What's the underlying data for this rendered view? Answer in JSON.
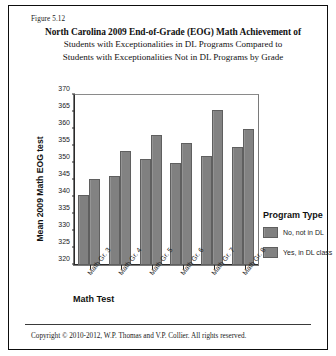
{
  "figure": {
    "caption": "Figure 5.12",
    "title_lines": [
      "North Carolina 2009 End-of-Grade (EOG) Math Achievement of",
      "Students with Exceptionalities in DL Programs Compared to",
      "Students with Exceptionalities Not in DL Programs by Grade"
    ],
    "copyright": "Copyright © 2010-2012, W.P. Thomas and V.P. Collier.  All rights reserved."
  },
  "legend": {
    "title": "Program Type",
    "entries": [
      {
        "label": "No, not in DL",
        "color": "#808080"
      },
      {
        "label": "Yes, in DL class",
        "color": "#828282"
      }
    ]
  },
  "chart_data": {
    "type": "bar",
    "title": "North Carolina 2009 End-of-Grade (EOG) Math Achievement of Students with Exceptionalities in DL Programs Compared to Students with Exceptionalities Not in DL Programs by Grade",
    "xlabel": "Math Test",
    "ylabel": "Mean 2009 Math EOG test",
    "categories": [
      "Math Gr. 3",
      "Math Gr. 4",
      "Math Gr. 5",
      "Math Gr. 6",
      "Math Gr. 7",
      "Math Gr. 8"
    ],
    "series": [
      {
        "name": "No, not in DL",
        "color": "#808080",
        "values": [
          340.5,
          346.3,
          351.3,
          350.0,
          352.1,
          354.6
        ]
      },
      {
        "name": "Yes, in DL class",
        "color": "#828282",
        "values": [
          345.2,
          353.5,
          358.3,
          356.0,
          365.7,
          360.0
        ]
      }
    ],
    "ylim": [
      320,
      370
    ],
    "ytick_step": 5,
    "yticks": [
      320,
      325,
      330,
      335,
      340,
      345,
      350,
      355,
      360,
      365,
      370
    ],
    "grid": false,
    "legend_position": "right"
  }
}
